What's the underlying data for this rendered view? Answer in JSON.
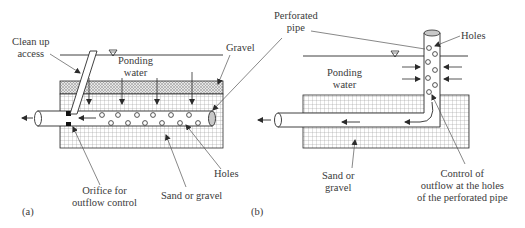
{
  "panels": [
    {
      "id": "a",
      "caption": "(a)",
      "labels": {
        "clean_up_line1": "Clean up",
        "clean_up_line2": "access",
        "ponding_line1": "Ponding",
        "ponding_line2": "water",
        "gravel": "Gravel",
        "holes": "Holes",
        "orifice_line1": "Orifice for",
        "orifice_line2": "outflow control",
        "sand": "Sand or gravel"
      }
    },
    {
      "id": "b",
      "caption": "(b)",
      "labels": {
        "perforated_line1": "Perforated",
        "perforated_line2": "pipe",
        "holes": "Holes",
        "ponding_line1": "Ponding",
        "ponding_line2": "water",
        "sand_line1": "Sand or",
        "sand_line2": "gravel",
        "control_line1": "Control of",
        "control_line2": "outflow at the holes",
        "control_line3": "of the perforated pipe"
      }
    }
  ],
  "colors": {
    "line": "#2b2b2b",
    "grid": "#8a8a8a",
    "crosshatch": "#9a9a9a",
    "pipe_end": "#c8c8c8",
    "leader": "#555555"
  }
}
